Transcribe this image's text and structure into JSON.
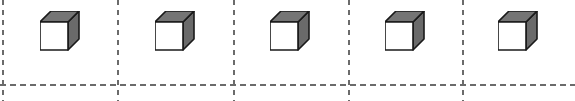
{
  "canvas": {
    "width": 575,
    "height": 101,
    "background_color": "#ffffff"
  },
  "grid": {
    "line_style": "dashed",
    "line_color": "#6b6b6b",
    "line_width": 1.6,
    "vertical_dash_pattern": "5 5",
    "horizontal_dash_pattern": "6 4",
    "vertical_lines": [
      {
        "name": "divider-0",
        "x": 3,
        "y1": 0,
        "y2": 101
      },
      {
        "name": "divider-1",
        "x": 118,
        "y1": 0,
        "y2": 101
      },
      {
        "name": "divider-2",
        "x": 234,
        "y1": 0,
        "y2": 101
      },
      {
        "name": "divider-3",
        "x": 349,
        "y1": 0,
        "y2": 101
      },
      {
        "name": "divider-4",
        "x": 463,
        "y1": 0,
        "y2": 101
      }
    ],
    "horizontal_lines": [
      {
        "name": "baseline",
        "y": 85,
        "x1": 0,
        "x2": 575
      }
    ]
  },
  "cube_style": {
    "front_face_color": "#ffffff",
    "top_face_color": "#757575",
    "side_face_color": "#6a6a6a",
    "outline_color": "#1a1a1a",
    "outline_width": 1.6,
    "size": 40
  },
  "cubes": [
    {
      "name": "cube-1",
      "cell": 1,
      "x": 40,
      "y": 11
    },
    {
      "name": "cube-2",
      "cell": 2,
      "x": 155,
      "y": 11
    },
    {
      "name": "cube-3",
      "cell": 3,
      "x": 270,
      "y": 11
    },
    {
      "name": "cube-4",
      "cell": 4,
      "x": 385,
      "y": 11
    },
    {
      "name": "cube-5",
      "cell": 5,
      "x": 498,
      "y": 11
    }
  ]
}
